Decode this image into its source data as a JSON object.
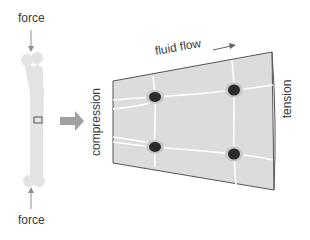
{
  "labels": {
    "force_top": "force",
    "force_bottom": "force",
    "fluid_flow": "fluid flow",
    "compression": "compression",
    "tension": "tension"
  },
  "colors": {
    "bone": "#e3e3e3",
    "tissue": "#dcdcdc",
    "cell_nucleus": "#2b2b2b",
    "canaliculi": "#ffffff",
    "arrow": "#8f8f8f",
    "outline": "#555555",
    "text": "#3a3a3a"
  },
  "diagram": {
    "bone": {
      "x": 40,
      "y_top": 72,
      "y_bottom": 180
    },
    "panel": {
      "corners": [
        [
          113,
          81
        ],
        [
          272,
          52
        ],
        [
          274,
          190
        ],
        [
          113,
          163
        ]
      ]
    },
    "cells": [
      {
        "cx": 155,
        "cy": 97
      },
      {
        "cx": 234,
        "cy": 90
      },
      {
        "cx": 155,
        "cy": 147
      },
      {
        "cx": 234,
        "cy": 154
      }
    ]
  }
}
